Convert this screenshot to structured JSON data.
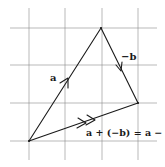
{
  "diagram": {
    "grid": {
      "vertical_x": [
        29,
        65,
        102,
        138
      ],
      "horizontal_y": [
        28,
        65,
        103,
        141
      ],
      "x_extent": [
        10,
        157
      ],
      "y_extent": [
        8,
        160
      ],
      "color": "#8a8a8a"
    },
    "points": {
      "origin": {
        "x": 29,
        "y": 141
      },
      "apex": {
        "x": 101,
        "y": 28
      },
      "right": {
        "x": 138,
        "y": 103
      }
    },
    "vectors": [
      {
        "id": "a",
        "label": "a",
        "from": "origin",
        "to": "apex"
      },
      {
        "id": "neg_b",
        "label": "−b",
        "from": "apex",
        "to": "right"
      },
      {
        "id": "result",
        "label": "a + (−b) = a − b",
        "from": "origin",
        "to": "right"
      }
    ],
    "labels": {
      "a": "a",
      "neg_b": "−b",
      "result": "a + (−b) = a − b"
    },
    "colors": {
      "ink": "#1a1a1a",
      "background": "#ffffff"
    }
  }
}
